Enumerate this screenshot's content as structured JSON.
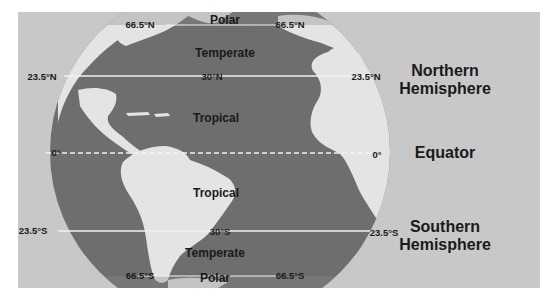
{
  "colors": {
    "background": "#ffffff",
    "panel": "#c8c8c8",
    "ocean": "#6e6e6e",
    "land": "#e4e4e4",
    "polar_band": "#8a8a8a",
    "lines": "#f2f2f2",
    "text": "#1a1a1a"
  },
  "latitudes": {
    "n66_left": "66.5°N",
    "n66_right": "66.5°N",
    "n23_left": "23.5°N",
    "n23_right": "23.5°N",
    "n30": "30°N",
    "eq_left": "0°",
    "eq_right": "0°",
    "s23_left": "23.5°S",
    "s23_right": "23.5°S",
    "s30": "30°S",
    "s66_left": "66.5°S",
    "s66_right": "66.5°S"
  },
  "zones": {
    "polar_north": "Polar",
    "temperate_north": "Temperate",
    "tropical_north": "Tropical",
    "tropical_south": "Tropical",
    "temperate_south": "Temperate",
    "polar_south": "Polar"
  },
  "hemispheres": {
    "northern_line1": "Northern",
    "northern_line2": "Hemisphere",
    "equator": "Equator",
    "southern_line1": "Southern",
    "southern_line2": "Hemisphere"
  }
}
